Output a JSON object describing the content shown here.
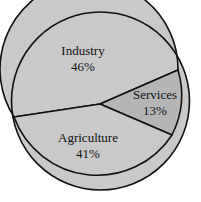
{
  "chart_data": {
    "type": "pie",
    "title": "",
    "subtitle": "",
    "xlabel": "",
    "ylabel": "",
    "legend_position": "none",
    "grid": false,
    "labels_inside_slices": true,
    "categories": [
      "Industry",
      "Services",
      "Agriculture"
    ],
    "values": [
      46,
      13,
      41
    ],
    "value_suffix": "%",
    "total": 100,
    "slices": [
      {
        "name": "Industry",
        "label": "Industry",
        "value": 46,
        "value_text": "46%",
        "fill": "#c9c9c9",
        "label_x": 83,
        "label_y": 52,
        "value_x": 83,
        "value_y": 68,
        "path": "M 100 104 L 14 117 A 89 89 0 1 1 178 70 Z"
      },
      {
        "name": "Services",
        "label": "Services",
        "value": 13,
        "value_text": "13%",
        "fill": "#b5b5b5",
        "label_x": 155,
        "label_y": 96,
        "value_x": 155,
        "value_y": 112,
        "path": "M 100 104 L 178 70 A 89 89 0 0 1 172 135 Z"
      },
      {
        "name": "Agriculture",
        "label": "Agriculture",
        "value": 41,
        "value_text": "41%",
        "fill": "#c9c9c9",
        "label_x": 88,
        "label_y": 139,
        "value_x": 88,
        "value_y": 155,
        "path": "M 100 104 L 172 135 A 89 89 0 0 1 14 117 Z"
      }
    ],
    "geometry": {
      "center_x": 100.5,
      "center_y": 101,
      "radius": 89,
      "vertex_x": 100,
      "vertex_y": 104
    },
    "style": {
      "background": "#ffffff",
      "outline_color": "#111111",
      "outline_width": 1.6,
      "divider_color": "#111111",
      "divider_width": 1.6,
      "text_color": "#111111"
    }
  }
}
